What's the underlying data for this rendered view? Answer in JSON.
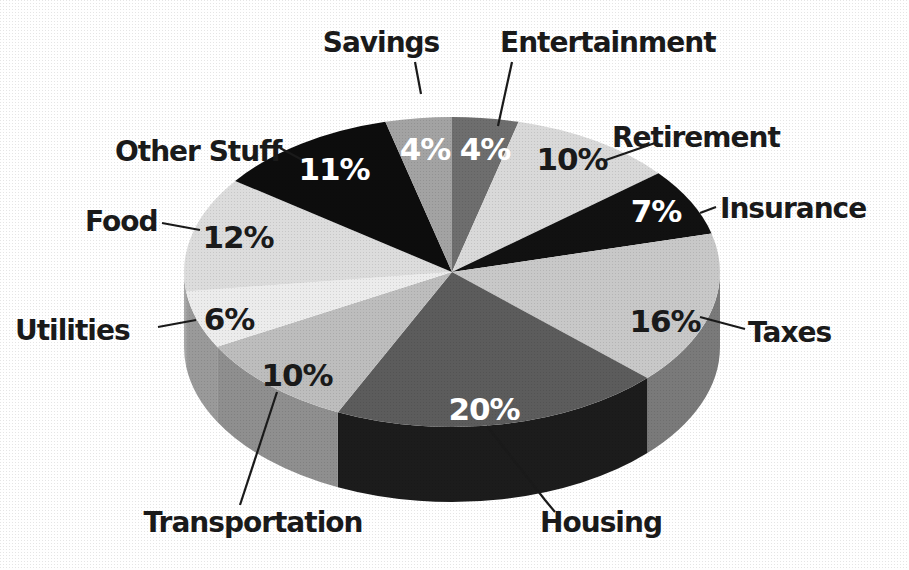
{
  "chart_data": {
    "type": "pie",
    "style": "3d-pie",
    "title": "",
    "start_angle_deg": 0,
    "direction": "clockwise",
    "unit": "%",
    "slices": [
      {
        "label": "Entertainment",
        "value": 4,
        "value_label": "4%",
        "color": "#6e6e6e",
        "side": "#555555",
        "text_color": "#ffffff"
      },
      {
        "label": "Retirement",
        "value": 10,
        "value_label": "10%",
        "color": "#d9d9d9",
        "side": "#b5b5b5",
        "text_color": "#1a1a1a"
      },
      {
        "label": "Insurance",
        "value": 7,
        "value_label": "7%",
        "color": "#111111",
        "side": "#0a0a0a",
        "text_color": "#ffffff"
      },
      {
        "label": "Taxes",
        "value": 16,
        "value_label": "16%",
        "color": "#c8c8c8",
        "side": "#7a7a7a",
        "text_color": "#1a1a1a"
      },
      {
        "label": "Housing",
        "value": 20,
        "value_label": "20%",
        "color": "#5c5c5c",
        "side": "#1c1c1c",
        "text_color": "#ffffff"
      },
      {
        "label": "Transportation",
        "value": 10,
        "value_label": "10%",
        "color": "#bdbdbd",
        "side": "#8f8f8f",
        "text_color": "#1a1a1a"
      },
      {
        "label": "Utilities",
        "value": 6,
        "value_label": "6%",
        "color": "#ececec",
        "side": "#9a9a9a",
        "text_color": "#1a1a1a"
      },
      {
        "label": "Food",
        "value": 12,
        "value_label": "12%",
        "color": "#dcdcdc",
        "side": "#a8a8a8",
        "text_color": "#1a1a1a"
      },
      {
        "label": "Other Stuff",
        "value": 11,
        "value_label": "11%",
        "color": "#0d0d0d",
        "side": "#050505",
        "text_color": "#ffffff"
      },
      {
        "label": "Savings",
        "value": 4,
        "value_label": "4%",
        "color": "#a3a3a3",
        "side": "#858585",
        "text_color": "#ffffff"
      }
    ],
    "legend": "none (callout labels with leader lines)"
  }
}
